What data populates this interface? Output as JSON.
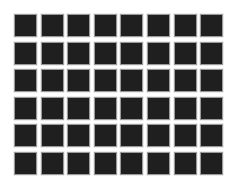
{
  "grid": {
    "rows": 6,
    "columns": 8,
    "cell_color": "#1f1f1f",
    "border_color": "#9a9a9a",
    "background_color": "#ffffff"
  }
}
